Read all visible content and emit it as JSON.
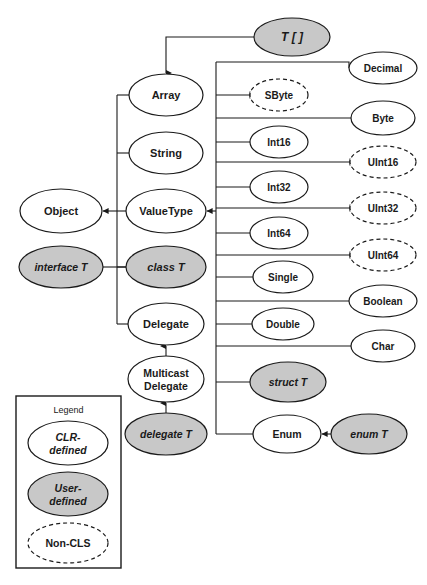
{
  "figure": {
    "colors": {
      "user_defined_fill": "#c8c8c8",
      "clr_defined_fill": "#ffffff",
      "stroke": "#1a1a1a",
      "background": "#ffffff"
    }
  },
  "nodes": [
    {
      "id": "t-array",
      "label": "T [ ]",
      "style": "user-defined",
      "border": "solid",
      "italic": true,
      "cx": 292,
      "cy": 37,
      "rx": 38,
      "ry": 19,
      "font": 12
    },
    {
      "id": "array",
      "label": "Array",
      "style": "clr-defined",
      "border": "solid",
      "italic": false,
      "cx": 166,
      "cy": 95,
      "rx": 37,
      "ry": 21,
      "font": 11
    },
    {
      "id": "string",
      "label": "String",
      "style": "clr-defined",
      "border": "solid",
      "italic": false,
      "cx": 166,
      "cy": 153,
      "rx": 37,
      "ry": 21,
      "font": 11
    },
    {
      "id": "object",
      "label": "Object",
      "style": "clr-defined",
      "border": "solid",
      "italic": false,
      "cx": 61,
      "cy": 211,
      "rx": 41,
      "ry": 22,
      "font": 11
    },
    {
      "id": "valuetype",
      "label": "ValueType",
      "style": "clr-defined",
      "border": "solid",
      "italic": false,
      "cx": 166,
      "cy": 211,
      "rx": 40,
      "ry": 22,
      "font": 11
    },
    {
      "id": "interface-t",
      "label": "interface T",
      "style": "user-defined",
      "border": "solid",
      "italic": true,
      "cx": 61,
      "cy": 267,
      "rx": 42,
      "ry": 21,
      "font": 10.5
    },
    {
      "id": "class-t",
      "label": "class T",
      "style": "user-defined",
      "border": "solid",
      "italic": true,
      "cx": 166,
      "cy": 267,
      "rx": 40,
      "ry": 21,
      "font": 11
    },
    {
      "id": "delegate",
      "label": "Delegate",
      "style": "clr-defined",
      "border": "solid",
      "italic": false,
      "cx": 166,
      "cy": 324,
      "rx": 38,
      "ry": 21,
      "font": 11
    },
    {
      "id": "multicast",
      "label": "Multicast Delegate",
      "style": "clr-defined",
      "border": "solid",
      "italic": false,
      "cx": 166,
      "cy": 379,
      "rx": 38,
      "ry": 23,
      "font": 10.5,
      "lines": [
        "Multicast",
        "Delegate"
      ]
    },
    {
      "id": "delegate-t",
      "label": "delegate T",
      "style": "user-defined",
      "border": "solid",
      "italic": true,
      "cx": 166,
      "cy": 434,
      "rx": 41,
      "ry": 21,
      "font": 10.5
    },
    {
      "id": "sbyte",
      "label": "SByte",
      "style": "non-cls",
      "border": "dashed",
      "italic": false,
      "cx": 279,
      "cy": 95,
      "rx": 29,
      "ry": 16,
      "font": 10
    },
    {
      "id": "int16",
      "label": "Int16",
      "style": "clr-defined",
      "border": "solid",
      "italic": false,
      "cx": 279,
      "cy": 142,
      "rx": 29,
      "ry": 16,
      "font": 10
    },
    {
      "id": "int32",
      "label": "Int32",
      "style": "clr-defined",
      "border": "solid",
      "italic": false,
      "cx": 279,
      "cy": 187,
      "rx": 29,
      "ry": 16,
      "font": 10
    },
    {
      "id": "int64",
      "label": "Int64",
      "style": "clr-defined",
      "border": "solid",
      "italic": false,
      "cx": 279,
      "cy": 233,
      "rx": 29,
      "ry": 16,
      "font": 10
    },
    {
      "id": "single",
      "label": "Single",
      "style": "clr-defined",
      "border": "solid",
      "italic": false,
      "cx": 283,
      "cy": 277,
      "rx": 30,
      "ry": 16,
      "font": 10
    },
    {
      "id": "double",
      "label": "Double",
      "style": "clr-defined",
      "border": "solid",
      "italic": false,
      "cx": 283,
      "cy": 324,
      "rx": 31,
      "ry": 16,
      "font": 10
    },
    {
      "id": "struct-t",
      "label": "struct T",
      "style": "user-defined",
      "border": "solid",
      "italic": true,
      "cx": 288,
      "cy": 382,
      "rx": 38,
      "ry": 20,
      "font": 10.5
    },
    {
      "id": "enum",
      "label": "Enum",
      "style": "clr-defined",
      "border": "solid",
      "italic": false,
      "cx": 287,
      "cy": 434,
      "rx": 34,
      "ry": 19,
      "font": 10.5
    },
    {
      "id": "decimal",
      "label": "Decimal",
      "style": "clr-defined",
      "border": "solid",
      "italic": false,
      "cx": 383,
      "cy": 68,
      "rx": 34,
      "ry": 16,
      "font": 10
    },
    {
      "id": "byte",
      "label": "Byte",
      "style": "clr-defined",
      "border": "solid",
      "italic": false,
      "cx": 383,
      "cy": 118,
      "rx": 32,
      "ry": 17,
      "font": 10
    },
    {
      "id": "uint16",
      "label": "UInt16",
      "style": "non-cls",
      "border": "dashed",
      "italic": false,
      "cx": 383,
      "cy": 162,
      "rx": 33,
      "ry": 16,
      "font": 10
    },
    {
      "id": "uint32",
      "label": "UInt32",
      "style": "non-cls",
      "border": "dashed",
      "italic": false,
      "cx": 383,
      "cy": 208,
      "rx": 33,
      "ry": 16,
      "font": 10
    },
    {
      "id": "uint64",
      "label": "UInt64",
      "style": "non-cls",
      "border": "dashed",
      "italic": false,
      "cx": 383,
      "cy": 255,
      "rx": 33,
      "ry": 16,
      "font": 10
    },
    {
      "id": "boolean",
      "label": "Boolean",
      "style": "clr-defined",
      "border": "solid",
      "italic": false,
      "cx": 383,
      "cy": 301,
      "rx": 34,
      "ry": 16,
      "font": 10
    },
    {
      "id": "char",
      "label": "Char",
      "style": "clr-defined",
      "border": "solid",
      "italic": false,
      "cx": 383,
      "cy": 346,
      "rx": 32,
      "ry": 16,
      "font": 10
    },
    {
      "id": "enum-t",
      "label": "enum T",
      "style": "user-defined",
      "border": "solid",
      "italic": true,
      "cx": 369,
      "cy": 434,
      "rx": 38,
      "ry": 20,
      "font": 10.5
    }
  ],
  "legend": {
    "title": "Legend",
    "box": {
      "x": 16,
      "y": 396,
      "width": 105,
      "height": 172
    },
    "items": [
      {
        "id": "legend-clr",
        "label": "CLR- defined",
        "lines": [
          "CLR-",
          "defined"
        ],
        "style": "clr-defined",
        "border": "solid",
        "italic": true,
        "cx": 68,
        "cy": 443,
        "rx": 40,
        "ry": 22,
        "font": 10.5
      },
      {
        "id": "legend-user",
        "label": "User- defined",
        "lines": [
          "User-",
          "defined"
        ],
        "style": "user-defined",
        "border": "solid",
        "italic": true,
        "cx": 68,
        "cy": 494,
        "rx": 40,
        "ry": 22,
        "font": 10.5
      },
      {
        "id": "legend-noncls",
        "label": "Non-CLS",
        "lines": [
          "Non-CLS"
        ],
        "style": "non-cls",
        "border": "dashed",
        "italic": false,
        "cx": 68,
        "cy": 543,
        "rx": 40,
        "ry": 20,
        "font": 10.5
      }
    ]
  },
  "edges": [
    {
      "id": "edge-tarray-array",
      "from": "t-array",
      "to": "array",
      "arrow": true
    },
    {
      "id": "edge-array-spine",
      "from": "array",
      "to": "spine-left",
      "arrow": false
    },
    {
      "id": "edge-string-spine",
      "from": "string",
      "to": "spine-left",
      "arrow": false
    },
    {
      "id": "edge-valuetype-object",
      "from": "valuetype",
      "to": "object",
      "arrow": true
    },
    {
      "id": "edge-classt-spine",
      "from": "class-t",
      "to": "spine-left",
      "arrow": false
    },
    {
      "id": "edge-interfacet-spine",
      "from": "interface-t",
      "to": "spine-left",
      "arrow": false
    },
    {
      "id": "edge-delegate-spine",
      "from": "delegate",
      "to": "spine-left",
      "arrow": false
    },
    {
      "id": "edge-multicast-delegate",
      "from": "multicast",
      "to": "delegate",
      "arrow": true
    },
    {
      "id": "edge-delegatet-multicast",
      "from": "delegate-t",
      "to": "multicast",
      "arrow": true
    },
    {
      "id": "edge-spineright-valuetype",
      "from": "spine-right",
      "to": "valuetype",
      "arrow": true
    },
    {
      "id": "edge-enumt-enum",
      "from": "enum-t",
      "to": "enum",
      "arrow": true
    },
    {
      "id": "edge-sbyte-spine",
      "from": "sbyte",
      "to": "spine-right",
      "arrow": false
    },
    {
      "id": "edge-int16-spine",
      "from": "int16",
      "to": "spine-right",
      "arrow": false
    },
    {
      "id": "edge-int32-spine",
      "from": "int32",
      "to": "spine-right",
      "arrow": false
    },
    {
      "id": "edge-int64-spine",
      "from": "int64",
      "to": "spine-right",
      "arrow": false
    },
    {
      "id": "edge-single-spine",
      "from": "single",
      "to": "spine-right",
      "arrow": false
    },
    {
      "id": "edge-double-spine",
      "from": "double",
      "to": "spine-right",
      "arrow": false
    },
    {
      "id": "edge-structt-spine",
      "from": "struct-t",
      "to": "spine-right",
      "arrow": false
    },
    {
      "id": "edge-enum-spine",
      "from": "enum",
      "to": "spine-right",
      "arrow": false
    },
    {
      "id": "edge-decimal-spine",
      "from": "decimal",
      "to": "spine-right",
      "arrow": false
    },
    {
      "id": "edge-byte-spine",
      "from": "byte",
      "to": "spine-right",
      "arrow": false
    },
    {
      "id": "edge-uint16-spine",
      "from": "uint16",
      "to": "spine-right",
      "arrow": false
    },
    {
      "id": "edge-uint32-spine",
      "from": "uint32",
      "to": "spine-right",
      "arrow": false
    },
    {
      "id": "edge-uint64-spine",
      "from": "uint64",
      "to": "spine-right",
      "arrow": false
    },
    {
      "id": "edge-boolean-spine",
      "from": "boolean",
      "to": "spine-right",
      "arrow": false
    },
    {
      "id": "edge-char-spine",
      "from": "char",
      "to": "spine-right",
      "arrow": false
    }
  ]
}
